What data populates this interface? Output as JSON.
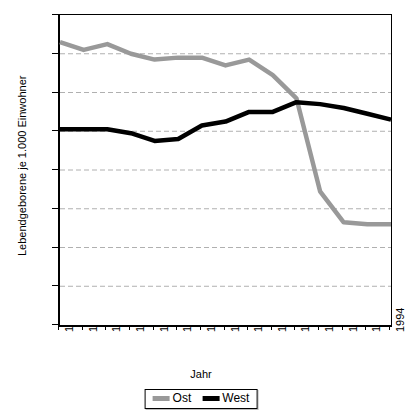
{
  "chart_data": {
    "type": "line",
    "title": "",
    "xlabel": "Jahr",
    "ylabel": "Lebendgeborene je 1.000 Einwohner",
    "categories": [
      "1980",
      "1981",
      "1982",
      "1983",
      "1984",
      "1985",
      "1986",
      "1987",
      "1988",
      "1989",
      "1990",
      "1991",
      "1992",
      "1993",
      "1994"
    ],
    "series": [
      {
        "name": "Ost",
        "color": "#999999",
        "values": [
          14.6,
          14.2,
          14.5,
          14.0,
          13.7,
          13.8,
          13.8,
          13.4,
          13.7,
          12.9,
          11.7,
          6.9,
          5.3,
          5.2,
          5.2
        ]
      },
      {
        "name": "West",
        "color": "#000000",
        "values": [
          10.1,
          10.1,
          10.1,
          9.9,
          9.5,
          9.6,
          10.3,
          10.5,
          11.0,
          11.0,
          11.5,
          11.4,
          11.2,
          10.9,
          10.6
        ]
      }
    ],
    "ylim": [
      0,
      16
    ],
    "yticks": [
      0,
      2,
      4,
      6,
      8,
      10,
      12,
      14,
      16
    ],
    "ytick_labels": [
      "0",
      "2",
      "4",
      "6",
      "8",
      "10",
      "12",
      "14",
      "16"
    ],
    "grid": true,
    "grid_color": "#b0b0b0",
    "legend_position": "bottom"
  },
  "legend": {
    "entries": [
      {
        "label": "Ost",
        "color": "#999999"
      },
      {
        "label": "West",
        "color": "#000000"
      }
    ]
  },
  "axes": {
    "x_title": "Jahr",
    "y_title": "Lebendgeborene je 1.000 Einwohner"
  }
}
